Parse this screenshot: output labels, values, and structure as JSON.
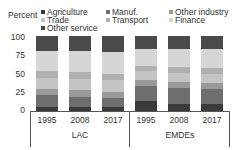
{
  "chart_data": {
    "type": "bar",
    "stacked": true,
    "title": "",
    "xlabel": "",
    "ylabel": "Percent",
    "ylim": [
      0,
      100
    ],
    "yticks": [
      "0",
      "25",
      "50",
      "75",
      "100"
    ],
    "groups": [
      "LAC",
      "EMDEs"
    ],
    "categories": [
      "1995",
      "2008",
      "2017",
      "1995",
      "2008",
      "2017"
    ],
    "category_groups": [
      "LAC",
      "LAC",
      "LAC",
      "EMDEs",
      "EMDEs",
      "EMDEs"
    ],
    "legend_position": "top",
    "series": [
      {
        "name": "Agriculture",
        "color": "#3a3a3a",
        "values": [
          6,
          5,
          5,
          13,
          10,
          9
        ]
      },
      {
        "name": "Manuf.",
        "color": "#6e6e6e",
        "values": [
          15,
          14,
          13,
          20,
          21,
          20
        ]
      },
      {
        "name": "Other industry",
        "color": "#9a9a9a",
        "values": [
          8,
          9,
          8,
          8,
          8,
          8
        ]
      },
      {
        "name": "Trade",
        "color": "#c4c4c4",
        "values": [
          15,
          15,
          15,
          12,
          12,
          13
        ]
      },
      {
        "name": "Transport",
        "color": "#b0b0b0",
        "values": [
          9,
          9,
          9,
          7,
          8,
          8
        ]
      },
      {
        "name": "Finance",
        "color": "#d6d6d6",
        "values": [
          27,
          28,
          29,
          23,
          24,
          25
        ]
      },
      {
        "name": "Other service",
        "color": "#4a4a4a",
        "values": [
          20,
          20,
          21,
          17,
          17,
          17
        ]
      }
    ]
  },
  "legend": {
    "ylabel": "Percent",
    "items": [
      {
        "label": "Agriculture",
        "color": "#3a3a3a"
      },
      {
        "label": "Manuf.",
        "color": "#6e6e6e"
      },
      {
        "label": "Other industry",
        "color": "#9a9a9a"
      },
      {
        "label": "Trade",
        "color": "#c4c4c4"
      },
      {
        "label": "Transport",
        "color": "#b0b0b0"
      },
      {
        "label": "Finance",
        "color": "#d6d6d6"
      },
      {
        "label": "Other service",
        "color": "#4a4a4a"
      }
    ]
  },
  "axis": {
    "yticks": [
      "100",
      "75",
      "50",
      "25",
      "0"
    ],
    "xlabels": [
      "1995",
      "2008",
      "2017",
      "1995",
      "2008",
      "2017"
    ],
    "groups": [
      "LAC",
      "EMDEs"
    ]
  }
}
